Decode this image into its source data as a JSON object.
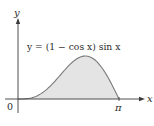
{
  "chart_data": {
    "type": "area",
    "title": "",
    "equation_label": "y = (1 − cos x) sin x",
    "xlabel": "x",
    "ylabel": "y",
    "x_ticks": [
      {
        "value": 0,
        "label": "0"
      },
      {
        "value": 3.14159,
        "label": "π"
      }
    ],
    "xlim": [
      0,
      3.14159
    ],
    "ylim": [
      0,
      1.3
    ],
    "grid": false,
    "legend": "none",
    "series": [
      {
        "name": "y = (1 − cos x) sin x",
        "x": [
          0,
          0.314,
          0.628,
          0.942,
          1.257,
          1.571,
          1.885,
          2.094,
          2.199,
          2.513,
          2.827,
          3.142
        ],
        "values": [
          0,
          0.015,
          0.112,
          0.336,
          0.662,
          1.0,
          1.251,
          1.299,
          1.29,
          1.106,
          0.596,
          0
        ],
        "fill": "#e4e4e4",
        "stroke": "#7a7a7a"
      }
    ]
  },
  "labels": {
    "origin": "0",
    "x_end": "π",
    "x_axis": "x",
    "y_axis": "y",
    "equation": "y = (1 − cos x) sin x"
  },
  "colors": {
    "axis": "#3a3a3a",
    "curve": "#7a7a7a",
    "fill": "#e4e4e4"
  }
}
